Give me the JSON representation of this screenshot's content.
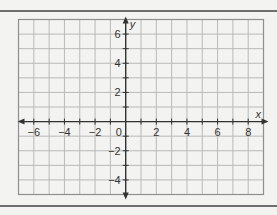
{
  "chart_data": {
    "type": "scatter",
    "title": "",
    "xlabel": "x",
    "ylabel": "y",
    "xlim": [
      -7,
      9
    ],
    "ylim": [
      -5,
      7
    ],
    "grid": true,
    "grid_step": 1,
    "x_ticks": [
      -6,
      -4,
      -2,
      2,
      4,
      6,
      8
    ],
    "y_ticks": [
      -4,
      -2,
      2,
      4,
      6
    ],
    "origin_label": "0",
    "x_tick_labels": [
      "−6",
      "−4",
      "−2",
      "2",
      "4",
      "6",
      "8"
    ],
    "y_tick_labels": [
      "−4",
      "−2",
      "2",
      "4",
      "6"
    ],
    "series": [],
    "legend": null
  },
  "style": {
    "background": "#f3f3f1",
    "grid_color": "#b9b9b9",
    "border_color": "#8f8f8f",
    "axis_color": "#333333",
    "rule_color": "#6e6e6e"
  }
}
